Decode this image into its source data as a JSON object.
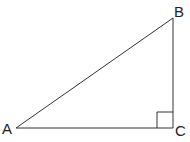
{
  "diagram": {
    "type": "right-triangle",
    "vertices": {
      "A": {
        "label": "A",
        "x": 16,
        "y": 128
      },
      "B": {
        "label": "B",
        "x": 173,
        "y": 18
      },
      "C": {
        "label": "C",
        "x": 173,
        "y": 128
      }
    },
    "right_angle_at": "C",
    "right_angle_marker_size": 16,
    "stroke_color": "#333333"
  }
}
